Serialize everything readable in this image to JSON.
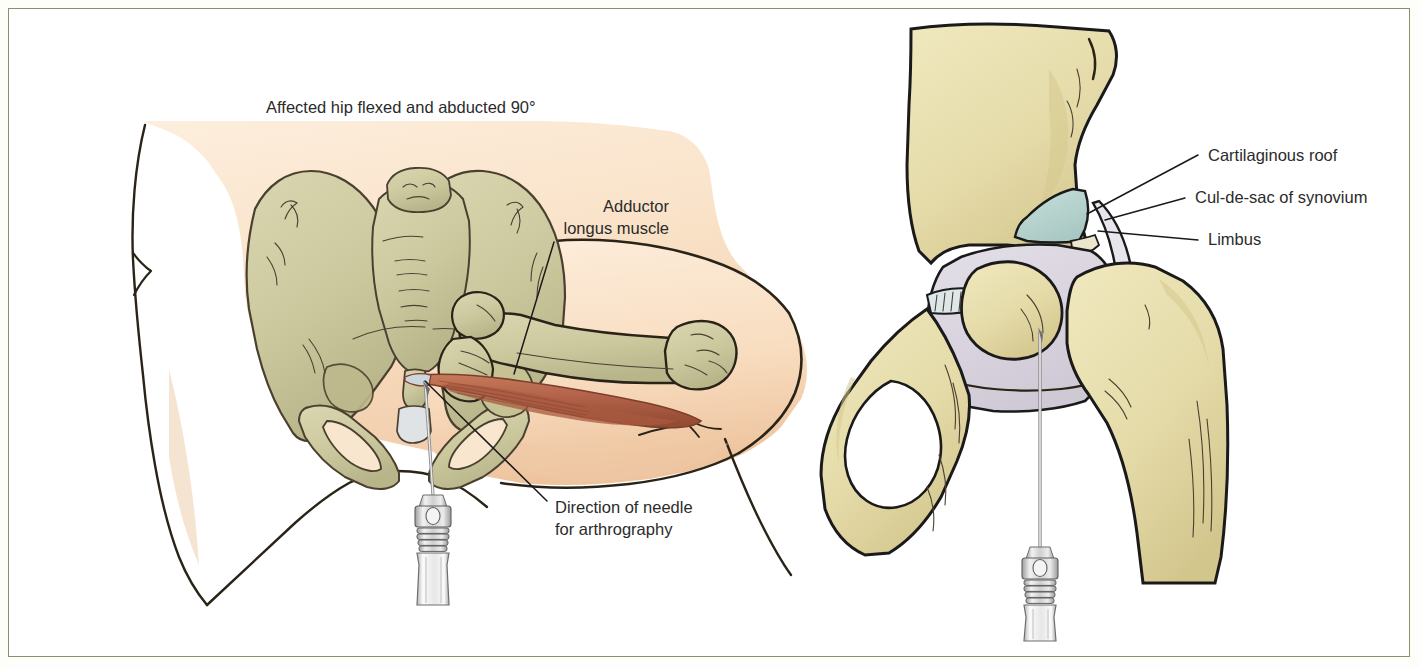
{
  "figure": {
    "kind": "medical-illustration",
    "topic": "Hip arthrography needle placement",
    "border_color": "#8e8e68",
    "background_color": "#ffffff"
  },
  "palette": {
    "skin": "#f9e3c9",
    "skin_shadow": "#f2cdaa",
    "bone_pelvis": "#cfcba2",
    "bone_pelvis_shadow": "#bdb98c",
    "bone_right": "#e6dcab",
    "bone_right_shadow": "#d6c98e",
    "muscle": "#b9674a",
    "muscle_shadow": "#9c5138",
    "capsule": "#d9d4de",
    "cartilage": "#bcd6d2",
    "outline": "#2a2317",
    "needle_metal": "#c9c9c9",
    "label_text": "#2b2b2b",
    "leader_line": "#1a1a1a"
  },
  "left_panel": {
    "name": "anterior-pelvis-view",
    "title": "Affected hip flexed and abducted 90°",
    "labels": [
      {
        "id": "adductor",
        "text_lines": [
          "Adductor",
          "longus muscle"
        ],
        "align": "right",
        "text_x": 660,
        "text_y": 203,
        "leader": {
          "from_x": 545,
          "from_y": 233,
          "to_x": 505,
          "to_y": 365
        }
      },
      {
        "id": "needle-direction",
        "text_lines": [
          "Direction of needle",
          "for arthrography"
        ],
        "align": "left",
        "text_x": 546,
        "text_y": 504,
        "leader": {
          "from_x": 538,
          "from_y": 492,
          "to_x": 416,
          "to_y": 372
        }
      }
    ],
    "structures": [
      "torso-skin",
      "pelvis-bone",
      "sacrum",
      "femur",
      "adductor-longus-muscle",
      "needle-and-hub"
    ]
  },
  "right_panel": {
    "name": "hip-joint-cross-section",
    "labels": [
      {
        "id": "cartilaginous-roof",
        "text": "Cartilaginous roof",
        "text_x": 1199,
        "text_y": 152,
        "leader": {
          "from_x": 1189,
          "from_y": 146,
          "to_x": 1078,
          "to_y": 205
        }
      },
      {
        "id": "cul-de-sac",
        "text": "Cul-de-sac of synovium",
        "text_x": 1186,
        "text_y": 194,
        "leader": {
          "from_x": 1176,
          "from_y": 189,
          "to_x": 1096,
          "to_y": 211
        }
      },
      {
        "id": "limbus",
        "text": "Limbus",
        "text_x": 1199,
        "text_y": 236,
        "leader": {
          "from_x": 1189,
          "from_y": 231,
          "to_x": 1089,
          "to_y": 222
        }
      }
    ],
    "structures": [
      "ilium",
      "pubis-ischium",
      "obturator-foramen",
      "femoral-head",
      "greater-trochanter",
      "femoral-shaft",
      "joint-capsule",
      "cartilaginous-roof",
      "limbus",
      "needle-and-hub"
    ]
  }
}
